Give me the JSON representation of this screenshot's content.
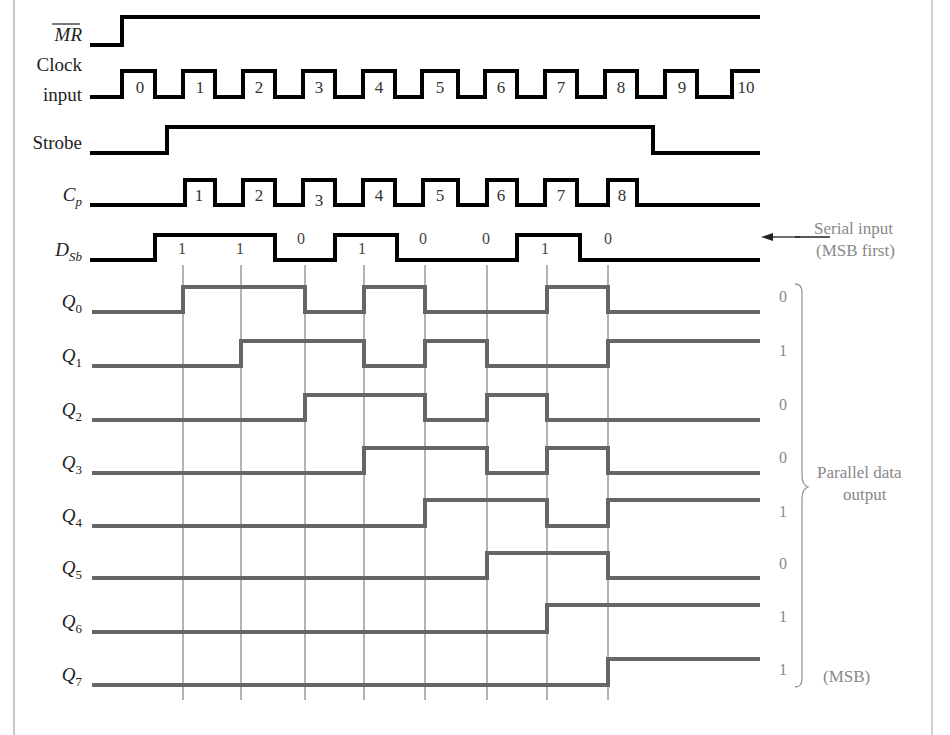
{
  "diagram": {
    "title_hidden": "",
    "signals": [
      {
        "id": "mr",
        "label": "MR",
        "overline": true,
        "italic": true,
        "color": "#000000",
        "y_low": 45,
        "y_high": 17,
        "edges": [
          [
            90,
            0
          ],
          [
            122,
            1
          ],
          [
            760,
            1
          ]
        ]
      },
      {
        "id": "clock",
        "label_lines": [
          "Clock",
          "input"
        ],
        "italic": false,
        "color": "#000000",
        "y_low": 97,
        "y_high": 71,
        "edges": [
          [
            90,
            0
          ],
          [
            122,
            1
          ],
          [
            155,
            0
          ],
          [
            183,
            1
          ],
          [
            215,
            0
          ],
          [
            243,
            1
          ],
          [
            275,
            0
          ],
          [
            303,
            1
          ],
          [
            335,
            0
          ],
          [
            363,
            1
          ],
          [
            395,
            0
          ],
          [
            422,
            1
          ],
          [
            458,
            0
          ],
          [
            485,
            1
          ],
          [
            517,
            0
          ],
          [
            545,
            1
          ],
          [
            577,
            0
          ],
          [
            605,
            1
          ],
          [
            637,
            0
          ],
          [
            665,
            1
          ],
          [
            697,
            0
          ],
          [
            732,
            1
          ],
          [
            760,
            1
          ]
        ],
        "pulse_labels": [
          {
            "x": 140,
            "text": "0"
          },
          {
            "x": 200,
            "text": "1"
          },
          {
            "x": 259,
            "text": "2"
          },
          {
            "x": 319,
            "text": "3"
          },
          {
            "x": 379,
            "text": "4"
          },
          {
            "x": 440,
            "text": "5"
          },
          {
            "x": 501,
            "text": "6"
          },
          {
            "x": 561,
            "text": "7"
          },
          {
            "x": 621,
            "text": "8"
          },
          {
            "x": 682,
            "text": "9"
          },
          {
            "x": 746,
            "text": "10"
          }
        ]
      },
      {
        "id": "strobe",
        "label": "Strobe",
        "italic": false,
        "color": "#000000",
        "y_low": 153,
        "y_high": 127,
        "edges": [
          [
            90,
            0
          ],
          [
            167,
            1
          ],
          [
            653,
            0
          ],
          [
            760,
            0
          ]
        ]
      },
      {
        "id": "cp",
        "label": "C",
        "label_sub": "p",
        "italic": true,
        "color": "#000000",
        "y_low": 205,
        "y_high": 180,
        "edges": [
          [
            90,
            0
          ],
          [
            185,
            1
          ],
          [
            215,
            0
          ],
          [
            243,
            1
          ],
          [
            275,
            0
          ],
          [
            303,
            1
          ],
          [
            335,
            0
          ],
          [
            363,
            1
          ],
          [
            395,
            0
          ],
          [
            423,
            1
          ],
          [
            458,
            0
          ],
          [
            487,
            1
          ],
          [
            517,
            0
          ],
          [
            545,
            1
          ],
          [
            577,
            0
          ],
          [
            608,
            1
          ],
          [
            637,
            0
          ],
          [
            760,
            0
          ]
        ],
        "pulse_labels": [
          {
            "x": 199,
            "text": "1",
            "y": 201
          },
          {
            "x": 259,
            "text": "2",
            "y": 201
          },
          {
            "x": 319,
            "text": "3",
            "y": 206
          },
          {
            "x": 379,
            "text": "4",
            "y": 201
          },
          {
            "x": 440,
            "text": "5",
            "y": 201
          },
          {
            "x": 501,
            "text": "6",
            "y": 201
          },
          {
            "x": 561,
            "text": "7",
            "y": 201
          },
          {
            "x": 622,
            "text": "8",
            "y": 201
          }
        ]
      },
      {
        "id": "dsb",
        "label": "D",
        "label_sub": "Sb",
        "italic": true,
        "color": "#000000",
        "y_low": 260,
        "y_high": 235,
        "edges": [
          [
            90,
            0
          ],
          [
            155,
            1
          ],
          [
            275,
            0
          ],
          [
            335,
            1
          ],
          [
            397,
            0
          ],
          [
            517,
            1
          ],
          [
            580,
            0
          ],
          [
            760,
            0
          ]
        ],
        "bit_labels": [
          {
            "x": 182,
            "y": 254,
            "text": "1"
          },
          {
            "x": 240,
            "y": 254,
            "text": "1"
          },
          {
            "x": 301,
            "y": 244,
            "text": "0"
          },
          {
            "x": 362,
            "y": 254,
            "text": "1"
          },
          {
            "x": 423,
            "y": 244,
            "text": "0"
          },
          {
            "x": 486,
            "y": 244,
            "text": "0"
          },
          {
            "x": 545,
            "y": 254,
            "text": "1"
          },
          {
            "x": 608,
            "y": 244,
            "text": "0"
          }
        ]
      }
    ],
    "outputs": [
      {
        "label": "Q",
        "sub": "0",
        "y_low": 312,
        "y_high": 287,
        "edges": [
          [
            92,
            0
          ],
          [
            183,
            1
          ],
          [
            305,
            0
          ],
          [
            364,
            1
          ],
          [
            425,
            0
          ],
          [
            547,
            1
          ],
          [
            608,
            0
          ],
          [
            760,
            0
          ]
        ],
        "final_bit": "0",
        "bit_y": 302
      },
      {
        "label": "Q",
        "sub": "1",
        "y_low": 366,
        "y_high": 341,
        "edges": [
          [
            92,
            0
          ],
          [
            241,
            1
          ],
          [
            364,
            0
          ],
          [
            425,
            1
          ],
          [
            487,
            0
          ],
          [
            608,
            1
          ],
          [
            760,
            1
          ]
        ],
        "final_bit": "1",
        "bit_y": 356
      },
      {
        "label": "Q",
        "sub": "2",
        "y_low": 420,
        "y_high": 395,
        "edges": [
          [
            92,
            0
          ],
          [
            305,
            1
          ],
          [
            425,
            0
          ],
          [
            487,
            1
          ],
          [
            547,
            0
          ],
          [
            760,
            0
          ]
        ],
        "final_bit": "0",
        "bit_y": 410
      },
      {
        "label": "Q",
        "sub": "3",
        "y_low": 473,
        "y_high": 448,
        "edges": [
          [
            92,
            0
          ],
          [
            364,
            1
          ],
          [
            487,
            0
          ],
          [
            547,
            1
          ],
          [
            608,
            0
          ],
          [
            760,
            0
          ]
        ],
        "final_bit": "0",
        "bit_y": 463
      },
      {
        "label": "Q",
        "sub": "4",
        "y_low": 526,
        "y_high": 500,
        "edges": [
          [
            92,
            0
          ],
          [
            425,
            1
          ],
          [
            547,
            0
          ],
          [
            608,
            1
          ],
          [
            760,
            1
          ]
        ],
        "final_bit": "1",
        "bit_y": 517
      },
      {
        "label": "Q",
        "sub": "5",
        "y_low": 578,
        "y_high": 553,
        "edges": [
          [
            92,
            0
          ],
          [
            487,
            1
          ],
          [
            608,
            0
          ],
          [
            760,
            0
          ]
        ],
        "final_bit": "0",
        "bit_y": 569
      },
      {
        "label": "Q",
        "sub": "6",
        "y_low": 632,
        "y_high": 605,
        "edges": [
          [
            92,
            0
          ],
          [
            547,
            1
          ],
          [
            760,
            1
          ]
        ],
        "final_bit": "1",
        "bit_y": 622
      },
      {
        "label": "Q",
        "sub": "7",
        "y_low": 685,
        "y_high": 659,
        "edges": [
          [
            92,
            0
          ],
          [
            608,
            1
          ],
          [
            760,
            1
          ]
        ],
        "final_bit": "1",
        "bit_y": 675
      }
    ],
    "output_color": "#666666",
    "grid_lines": [
      183,
      241,
      305,
      364,
      425,
      487,
      547,
      608
    ],
    "grid_top": 265,
    "grid_bottom": 700,
    "annotations": {
      "serial_input_line1": "Serial input",
      "serial_input_line2": "(MSB first)",
      "parallel_line1": "Parallel data",
      "parallel_line2": "output",
      "msb": "(MSB)"
    }
  }
}
